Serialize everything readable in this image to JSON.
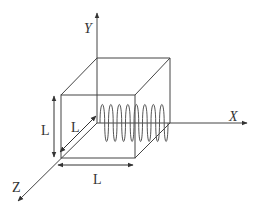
{
  "diagram": {
    "axes": {
      "x_label": "X",
      "y_label": "Y",
      "z_label": "Z"
    },
    "dimensions": {
      "height_label": "L",
      "depth_label": "L",
      "width_label": "L"
    },
    "colors": {
      "line": "#444444",
      "coil": "#555555",
      "background": "#ffffff"
    },
    "coil": {
      "turns": 8
    }
  }
}
